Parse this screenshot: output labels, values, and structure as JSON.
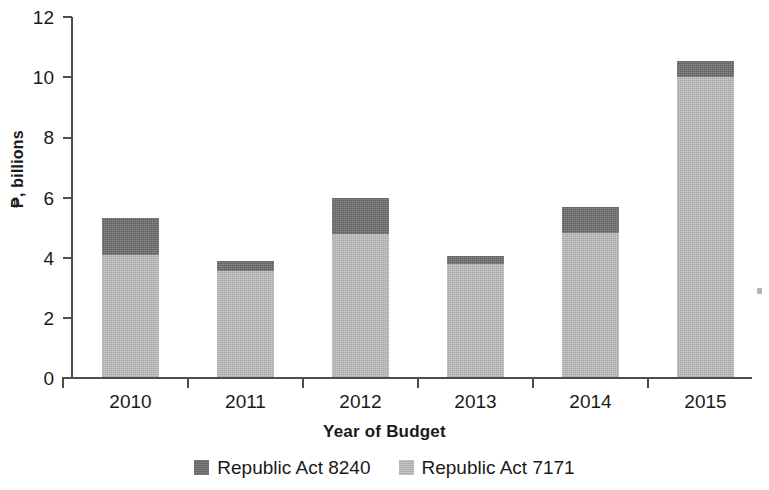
{
  "chart_data": {
    "type": "bar",
    "subtype": "stacked-vertical",
    "title": "",
    "subtitle": "",
    "xlabel": "Year of Budget",
    "ylabel": "₱, billions",
    "categories": [
      "2010",
      "2011",
      "2012",
      "2013",
      "2014",
      "2015"
    ],
    "series": [
      {
        "name": "Republic Act 7171",
        "color": "#b9b9b9",
        "stack_order": "bottom",
        "values": [
          4.1,
          3.57,
          4.78,
          3.79,
          4.81,
          10.0
        ]
      },
      {
        "name": "Republic Act 8240",
        "color": "#6d6d6d",
        "stack_order": "top",
        "values": [
          1.23,
          0.33,
          1.19,
          0.27,
          0.86,
          0.55
        ]
      }
    ],
    "totals": [
      5.33,
      3.9,
      5.97,
      4.06,
      5.67,
      10.55
    ],
    "ylim": [
      0,
      12
    ],
    "ytick_values": [
      0,
      2,
      4,
      6,
      8,
      10,
      12
    ],
    "ytick_labels": [
      "0",
      "2",
      "4",
      "6",
      "8",
      "10",
      "12"
    ],
    "grid": false,
    "legend_position": "bottom",
    "legend_entries": [
      "Republic Act 8240",
      "Republic Act 7171"
    ]
  },
  "axes": {
    "y_label": "₱, billions",
    "x_label": "Year of Budget",
    "y_ticks": [
      "12",
      "10",
      "8",
      "6",
      "4",
      "2",
      "0"
    ],
    "x_ticks": [
      "2010",
      "2011",
      "2012",
      "2013",
      "2014",
      "2015"
    ]
  },
  "legend": {
    "items": [
      {
        "label": "Republic Act 8240",
        "swatch": "dark"
      },
      {
        "label": "Republic Act 7171",
        "swatch": "light"
      }
    ]
  }
}
